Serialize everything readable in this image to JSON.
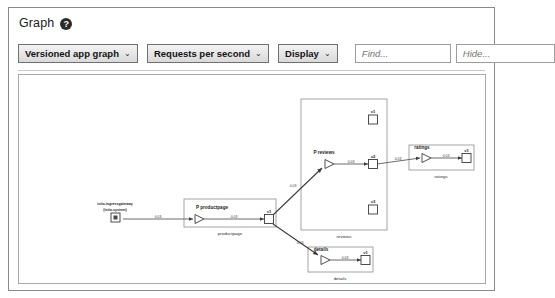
{
  "header": {
    "title": "Graph",
    "help_icon": "question-circle-icon"
  },
  "toolbar": {
    "graph_type_label": "Versioned app graph",
    "metric_label": "Requests per second",
    "display_label": "Display",
    "caret": "⌄",
    "find_placeholder": "Find...",
    "find_value": "",
    "hide_placeholder": "Hide...",
    "hide_value": ""
  },
  "graph": {
    "nodes": {
      "ingressgateway": {
        "name": "istio-ingressgateway",
        "namespace": "(istio-system)",
        "shape": "square"
      },
      "productpage_app": {
        "name": "P productpage",
        "shape": "triangle"
      },
      "productpage_v1": {
        "name": "v1",
        "shape": "square"
      },
      "reviews_app": {
        "name": "P reviews",
        "shape": "triangle"
      },
      "reviews_v1": {
        "name": "v1",
        "shape": "square"
      },
      "reviews_v2": {
        "name": "v2",
        "shape": "square"
      },
      "reviews_v3": {
        "name": "v3",
        "shape": "square"
      },
      "ratings_app": {
        "name": "ratings",
        "shape": "triangle"
      },
      "ratings_v1": {
        "name": "v1",
        "shape": "square"
      },
      "details_app": {
        "name": "details",
        "shape": "triangle"
      },
      "details_v1": {
        "name": "v1",
        "shape": "square"
      }
    },
    "groups": {
      "productpage": "productpage",
      "reviews": "reviews",
      "ratings": "ratings",
      "details": "details"
    },
    "edges": {
      "ingress_to_productpage": "0.03",
      "productpage_app_to_v1": "0.03",
      "productpage_to_reviews": "0.03",
      "productpage_to_details": "0.03",
      "reviews_app_to_v2": "0.03",
      "reviews_v2_to_ratings": "0.03",
      "ratings_app_to_v1": "0.03",
      "details_app_to_v1": "0.03"
    }
  },
  "colors": {
    "border": "#8a8a8a",
    "canvas_border": "#a8a8a8",
    "node_stroke": "#4a4a4a",
    "edge_stroke": "#5a5a5a",
    "text": "#1d1d1d",
    "button_face": "#e4e4e4"
  }
}
